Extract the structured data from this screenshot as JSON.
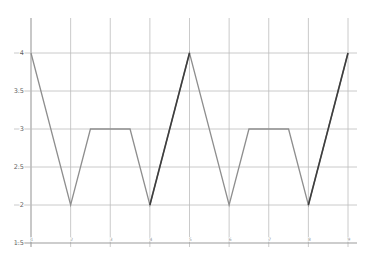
{
  "figure": {
    "background": "#ffffff",
    "grid_color": "#bcbcbc",
    "axis_line_color": "#9b9b9b",
    "tick_label_color": "#5f5f5f",
    "x_tick_label_color": "#9a9a9a",
    "line_color": "#8e8e8e",
    "dark_line_color": "#3e3e3e"
  },
  "chart_data": {
    "type": "line",
    "title": "",
    "xlabel": "",
    "ylabel": "",
    "grid": true,
    "legend_visible": false,
    "xlim": [
      1,
      9
    ],
    "ylim": [
      1.5,
      4
    ],
    "x_ticks": [
      1,
      2,
      3,
      4,
      5,
      6,
      7,
      8,
      9
    ],
    "y_ticks": [
      4,
      3.5,
      3,
      2.5,
      2,
      1.5
    ],
    "series": [
      {
        "name": "piecewise-wave",
        "type": "line",
        "color": "#8e8e8e",
        "points": [
          [
            1,
            4
          ],
          [
            2,
            2
          ],
          [
            2.5,
            3
          ],
          [
            3.5,
            3
          ],
          [
            4,
            2
          ],
          [
            5,
            4
          ],
          [
            6,
            2
          ],
          [
            6.5,
            3
          ],
          [
            7.5,
            3
          ],
          [
            8,
            2
          ],
          [
            9,
            4
          ]
        ]
      },
      {
        "name": "dark-rise-segments",
        "type": "line-segments",
        "color": "#3e3e3e",
        "segments": [
          [
            [
              4,
              2
            ],
            [
              5,
              4
            ]
          ],
          [
            [
              8,
              2
            ],
            [
              9,
              4
            ]
          ]
        ]
      }
    ]
  }
}
